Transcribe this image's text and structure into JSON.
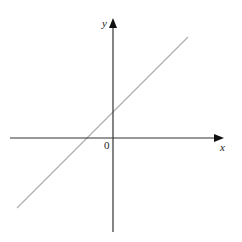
{
  "diagram": {
    "type": "coordinate-plane-linear-graph",
    "x_axis_label": "x",
    "y_axis_label": "y",
    "origin_label": "0",
    "line": {
      "description": "straight line with positive slope, x-intercept negative, y-intercept positive",
      "color": "#b0b0b0"
    },
    "axis_color": "#333333"
  }
}
